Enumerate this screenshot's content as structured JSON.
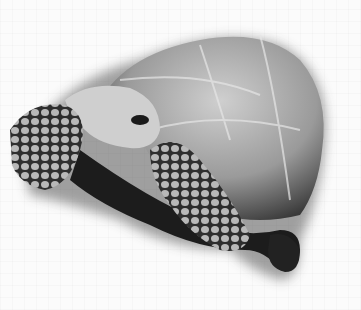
{
  "image": {
    "subject": "tortoise",
    "description": "Grayscale photograph of a tortoise with domed shell, head and scaly front legs, on a white background",
    "width": 361,
    "height": 310,
    "palette": {
      "background": "#fbfbfb",
      "shell_light": "#bdbdbd",
      "shell_mid": "#8a8a8a",
      "shadow": "#1a1a1a"
    }
  }
}
